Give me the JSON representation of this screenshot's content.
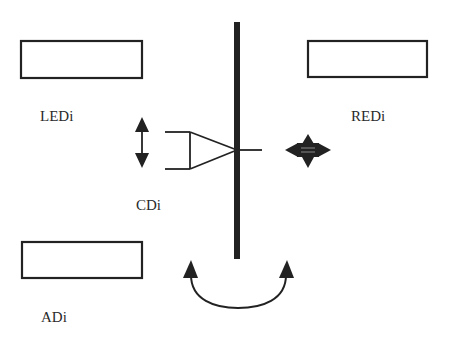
{
  "diagram": {
    "labels": {
      "led": "LEDi",
      "red": "REDi",
      "cd": "CDi",
      "ad": "ADi"
    },
    "colors": {
      "stroke": "#222222",
      "background": "#ffffff",
      "text": "#2a2a2a"
    },
    "elements": [
      {
        "id": "led-box",
        "type": "rectangle",
        "label": "LEDi"
      },
      {
        "id": "red-box",
        "type": "rectangle",
        "label": "REDi"
      },
      {
        "id": "ad-box",
        "type": "rectangle",
        "label": "ADi"
      },
      {
        "id": "cd-probe",
        "type": "triangle-probe",
        "label": "CDi"
      },
      {
        "id": "center-bar",
        "type": "vertical-bar"
      },
      {
        "id": "vertical-double-arrow",
        "type": "arrow-up-down"
      },
      {
        "id": "four-way-arrow",
        "type": "arrow-four-way"
      },
      {
        "id": "rotation-arrow",
        "type": "curved-double-arrow"
      }
    ]
  }
}
